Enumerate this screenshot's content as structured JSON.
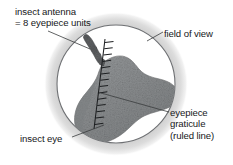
{
  "figure": {
    "background_color": "#ffffff",
    "labels": {
      "insect_antenna_line1": "insect antenna",
      "insect_antenna_line2": "= 8 eyepiece units",
      "field_of_view": "field of view",
      "eyepiece_graticule_line1": "eyepiece",
      "eyepiece_graticule_line2": "graticule",
      "eyepiece_graticule_line3": "(ruled line)",
      "insect_eye": "insect eye"
    },
    "colors": {
      "text": "#16181a",
      "leader_line": "#3a3c3e",
      "field_ring_outer": "#e8e8e8",
      "field_ring_mid": "#cfcfcf",
      "field_circle_outline": "#6b6d70",
      "field_interior": "#ffffff",
      "insect_eye_fill": "#8a8c8e",
      "insect_eye_edge": "#6e7072",
      "antenna_fill": "#5e6062",
      "graticule_line": "#1d1f21"
    },
    "graticule": {
      "units_spanned_by_antenna": 8,
      "tick_count": 14,
      "top_point": [
        105,
        40
      ],
      "bottom_point": [
        94,
        128
      ]
    },
    "field_of_view": {
      "center": [
        116,
        84
      ],
      "radius": 60
    }
  }
}
